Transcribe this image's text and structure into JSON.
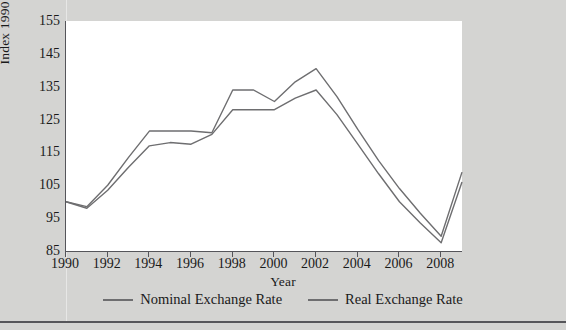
{
  "chart_data": {
    "type": "line",
    "title": "",
    "xlabel": "Year",
    "ylabel": "Index 1990 = 100",
    "xlim": [
      1990,
      2009
    ],
    "ylim": [
      85,
      155
    ],
    "yticks": [
      85,
      95,
      105,
      115,
      125,
      135,
      145,
      155
    ],
    "xticks": [
      1990,
      1992,
      1994,
      1996,
      1998,
      2000,
      2002,
      2004,
      2006,
      2008
    ],
    "grid": false,
    "legend_position": "bottom",
    "x": [
      1990,
      1991,
      1992,
      1993,
      1994,
      1995,
      1996,
      1997,
      1998,
      1999,
      2000,
      2001,
      2002,
      2003,
      2004,
      2005,
      2006,
      2007,
      2008,
      2009
    ],
    "series": [
      {
        "name": "Nominal Exchange Rate",
        "color": "#6e6e70",
        "values": [
          100.0,
          98.5,
          105.0,
          113.5,
          121.5,
          121.5,
          121.5,
          121.0,
          134.0,
          134.0,
          130.5,
          136.5,
          140.5,
          132.0,
          122.0,
          112.5,
          104.0,
          96.5,
          89.5,
          109.0
        ]
      },
      {
        "name": "Real Exchange Rate",
        "color": "#6e6e70",
        "values": [
          100.0,
          98.0,
          103.5,
          110.5,
          117.0,
          118.0,
          117.5,
          120.5,
          128.0,
          128.0,
          128.0,
          131.5,
          134.0,
          126.5,
          117.5,
          108.5,
          100.0,
          93.5,
          87.5,
          106.0
        ]
      }
    ]
  },
  "axis": {
    "y_title": "Index 1990 = 100",
    "x_title": "Year",
    "y_tick_labels": [
      "155",
      "145",
      "135",
      "125",
      "115",
      "105",
      "95",
      "85"
    ],
    "x_tick_labels": [
      "1990",
      "1992",
      "1994",
      "1996",
      "1998",
      "2000",
      "2002",
      "2004",
      "2006",
      "2008"
    ]
  },
  "legend": {
    "items": [
      {
        "label": "Nominal Exchange Rate"
      },
      {
        "label": "Real Exchange Rate"
      }
    ]
  },
  "style": {
    "page_background": "#d4d4d2",
    "plot_background": "#ffffff",
    "line_color": "#6e6e70",
    "axis_color": "#55555a"
  }
}
